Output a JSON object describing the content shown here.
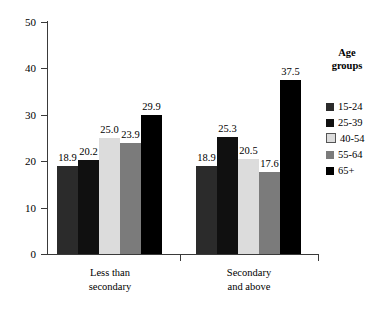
{
  "chart_data": {
    "type": "bar",
    "title": "",
    "subtitle": "",
    "xlabel": "",
    "ylabel": "",
    "ylim": [
      0,
      50
    ],
    "ytick_values": [
      50,
      40,
      30,
      20,
      10,
      0
    ],
    "ytick_labels": [
      "50",
      "40",
      "30",
      "20",
      "10",
      "0"
    ],
    "grid": false,
    "legend_position": "right",
    "legend_title_line1": "Age",
    "legend_title_line2": "groups",
    "categories": [
      "Less than secondary",
      "Secondary and above"
    ],
    "category_lines": [
      [
        "Less than",
        "secondary"
      ],
      [
        "Secondary",
        "and above"
      ]
    ],
    "series": [
      {
        "name": "15-24",
        "color": "#2b2b2b",
        "values": [
          18.9,
          18.9
        ],
        "value_labels": [
          "18.9",
          "18.9"
        ]
      },
      {
        "name": "25-39",
        "color": "#101010",
        "values": [
          20.2,
          25.3
        ],
        "value_labels": [
          "20.2",
          "25.3"
        ]
      },
      {
        "name": "40-54",
        "color": "#dcdcdc",
        "values": [
          25.0,
          20.5
        ],
        "value_labels": [
          "25.0",
          "20.5"
        ]
      },
      {
        "name": "55-64",
        "color": "#7b7b7b",
        "values": [
          23.9,
          17.6
        ],
        "value_labels": [
          "23.9",
          "17.6"
        ]
      },
      {
        "name": "65+",
        "color": "#000000",
        "values": [
          29.9,
          37.5
        ],
        "value_labels": [
          "29.9",
          "37.5"
        ]
      }
    ]
  }
}
